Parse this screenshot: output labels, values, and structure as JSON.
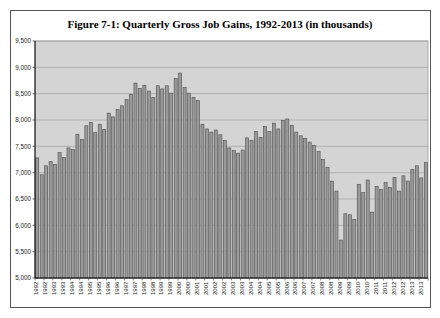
{
  "figure": {
    "title": "Figure 7-1: Quarterly Gross Job Gains, 1992-2013 (in thousands)"
  },
  "chart_data": {
    "type": "bar",
    "title": "Figure 7-1: Quarterly Gross Job Gains, 1992-2013 (in thousands)",
    "xlabel": "",
    "ylabel": "",
    "units": "thousands",
    "ylim": [
      5000,
      9500
    ],
    "ytick_interval": 500,
    "ytick_labels": [
      "5,000",
      "5,500",
      "6,000",
      "6,500",
      "7,000",
      "7,500",
      "8,000",
      "8,500",
      "9,000",
      "9,500"
    ],
    "xtick_rule": "year label shown under every other quarter (Q1 and Q3), rotated 90 degrees",
    "xtick_labels": [
      "1992",
      "1992",
      "1993",
      "1993",
      "1994",
      "1994",
      "1995",
      "1995",
      "1996",
      "1996",
      "1997",
      "1997",
      "1998",
      "1998",
      "1999",
      "1999",
      "2000",
      "2000",
      "2001",
      "2001",
      "2002",
      "2002",
      "2003",
      "2003",
      "2004",
      "2004",
      "2005",
      "2005",
      "2006",
      "2006",
      "2007",
      "2007",
      "2008",
      "2008",
      "2009",
      "2009",
      "2010",
      "2010",
      "2011",
      "2011",
      "2012",
      "2012",
      "2013",
      "2013"
    ],
    "grid": "horizontal",
    "legend": "none",
    "plot_bg_color": "#d4d4d4",
    "bar_fill_color": "#9a9a9a",
    "bar_border_color": "#4c4c4c",
    "gridline_color": "#999999",
    "categories": [
      "1992 Q1",
      "1992 Q2",
      "1992 Q3",
      "1992 Q4",
      "1993 Q1",
      "1993 Q2",
      "1993 Q3",
      "1993 Q4",
      "1994 Q1",
      "1994 Q2",
      "1994 Q3",
      "1994 Q4",
      "1995 Q1",
      "1995 Q2",
      "1995 Q3",
      "1995 Q4",
      "1996 Q1",
      "1996 Q2",
      "1996 Q3",
      "1996 Q4",
      "1997 Q1",
      "1997 Q2",
      "1997 Q3",
      "1997 Q4",
      "1998 Q1",
      "1998 Q2",
      "1998 Q3",
      "1998 Q4",
      "1999 Q1",
      "1999 Q2",
      "1999 Q3",
      "1999 Q4",
      "2000 Q1",
      "2000 Q2",
      "2000 Q3",
      "2000 Q4",
      "2001 Q1",
      "2001 Q2",
      "2001 Q3",
      "2001 Q4",
      "2002 Q1",
      "2002 Q2",
      "2002 Q3",
      "2002 Q4",
      "2003 Q1",
      "2003 Q2",
      "2003 Q3",
      "2003 Q4",
      "2004 Q1",
      "2004 Q2",
      "2004 Q3",
      "2004 Q4",
      "2005 Q1",
      "2005 Q2",
      "2005 Q3",
      "2005 Q4",
      "2006 Q1",
      "2006 Q2",
      "2006 Q3",
      "2006 Q4",
      "2007 Q1",
      "2007 Q2",
      "2007 Q3",
      "2007 Q4",
      "2008 Q1",
      "2008 Q2",
      "2008 Q3",
      "2008 Q4",
      "2009 Q1",
      "2009 Q2",
      "2009 Q3",
      "2009 Q4",
      "2010 Q1",
      "2010 Q2",
      "2010 Q3",
      "2010 Q4",
      "2011 Q1",
      "2011 Q2",
      "2011 Q3",
      "2011 Q4",
      "2012 Q1",
      "2012 Q2",
      "2012 Q3",
      "2012 Q4",
      "2013 Q1",
      "2013 Q2",
      "2013 Q3",
      "2013 Q4"
    ],
    "values": [
      7280,
      6960,
      7130,
      7210,
      7160,
      7380,
      7290,
      7470,
      7440,
      7730,
      7630,
      7890,
      7950,
      7760,
      7920,
      7820,
      8130,
      8060,
      8200,
      8270,
      8390,
      8490,
      8700,
      8600,
      8660,
      8550,
      8430,
      8650,
      8590,
      8650,
      8510,
      8790,
      8890,
      8620,
      8510,
      8430,
      8370,
      7920,
      7830,
      7770,
      7810,
      7720,
      7610,
      7470,
      7420,
      7370,
      7430,
      7660,
      7610,
      7780,
      7670,
      7880,
      7780,
      7940,
      7830,
      7990,
      8020,
      7900,
      7770,
      7700,
      7650,
      7580,
      7520,
      7400,
      7250,
      7100,
      6840,
      6650,
      5720,
      6220,
      6200,
      6110,
      6780,
      6620,
      6860,
      6250,
      6740,
      6680,
      6810,
      6720,
      6910,
      6650,
      6940,
      6840,
      7060,
      7130,
      6900,
      7190
    ]
  }
}
